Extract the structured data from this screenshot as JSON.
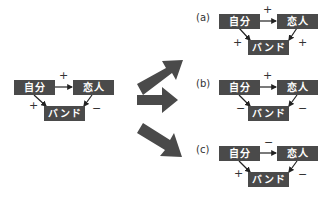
{
  "nodes": {
    "self": "自分",
    "lover": "恋人",
    "band": "バンド"
  },
  "colors": {
    "box": "#4a4a4a",
    "arrow": "#4a4a4a",
    "text": "#ffffff"
  },
  "left": {
    "self_lover": "+",
    "self_band": "+",
    "lover_band": "−"
  },
  "a": {
    "label": "(a)",
    "self_lover": "+",
    "self_band": "+",
    "lover_band": "+"
  },
  "b": {
    "label": "(b)",
    "self_lover": "+",
    "self_band": "−",
    "lover_band": "−"
  },
  "c": {
    "label": "(c)",
    "self_lover": "−",
    "self_band": "+",
    "lover_band": "−"
  }
}
